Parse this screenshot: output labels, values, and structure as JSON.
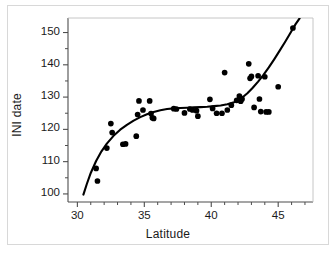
{
  "chart_data": {
    "type": "scatter",
    "title": "",
    "xlabel": "Latitude",
    "ylabel": "INI date",
    "xlim": [
      29.3,
      47.6
    ],
    "ylim": [
      97.5,
      154.5
    ],
    "grid": false,
    "legend": "none",
    "xticks": [
      30,
      35,
      40,
      45
    ],
    "xtick_labels": [
      "30",
      "35",
      "40",
      "45"
    ],
    "xminor_ticks": [
      31,
      32,
      33,
      34,
      36,
      37,
      38,
      39,
      41,
      42,
      43,
      44,
      46,
      47
    ],
    "yticks": [
      100,
      110,
      120,
      130,
      140,
      150
    ],
    "ytick_labels": [
      "100",
      "110",
      "120",
      "130",
      "140",
      "150"
    ],
    "yminor_ticks": [
      105,
      115,
      125,
      135,
      145
    ],
    "marker": "filled-circle",
    "marker_color": "#000000",
    "marker_size": 4.4,
    "series": [
      {
        "name": "observations",
        "points": [
          [
            31.4,
            107.9
          ],
          [
            31.5,
            104.0
          ],
          [
            32.2,
            114.2
          ],
          [
            32.5,
            121.8
          ],
          [
            32.6,
            119.0
          ],
          [
            33.4,
            115.4
          ],
          [
            33.6,
            115.5
          ],
          [
            34.4,
            117.9
          ],
          [
            34.5,
            124.6
          ],
          [
            34.6,
            128.8
          ],
          [
            34.9,
            126.0
          ],
          [
            35.4,
            128.8
          ],
          [
            35.5,
            124.9
          ],
          [
            35.6,
            123.6
          ],
          [
            35.7,
            123.4
          ],
          [
            37.2,
            126.4
          ],
          [
            37.4,
            126.3
          ],
          [
            38.0,
            125.1
          ],
          [
            38.4,
            126.3
          ],
          [
            38.6,
            126.0
          ],
          [
            38.9,
            125.8
          ],
          [
            39.0,
            124.1
          ],
          [
            39.9,
            129.3
          ],
          [
            40.1,
            126.5
          ],
          [
            40.4,
            125.0
          ],
          [
            40.8,
            125.0
          ],
          [
            41.0,
            137.6
          ],
          [
            41.2,
            126.0
          ],
          [
            41.5,
            127.5
          ],
          [
            41.9,
            129.0
          ],
          [
            42.1,
            130.3
          ],
          [
            42.2,
            129.7
          ],
          [
            42.2,
            128.7
          ],
          [
            42.3,
            129.4
          ],
          [
            42.8,
            140.3
          ],
          [
            42.9,
            135.8
          ],
          [
            43.0,
            136.4
          ],
          [
            43.2,
            126.8
          ],
          [
            43.5,
            136.6
          ],
          [
            43.6,
            129.4
          ],
          [
            43.7,
            125.5
          ],
          [
            44.0,
            136.3
          ],
          [
            44.1,
            125.4
          ],
          [
            44.3,
            125.4
          ],
          [
            45.0,
            133.2
          ],
          [
            46.1,
            151.4
          ]
        ]
      }
    ],
    "fit_curve": {
      "name": "fitted-trend",
      "color": "#000000",
      "line_width": 2.1,
      "points": [
        [
          30.45,
          99.8
        ],
        [
          30.7,
          103.0
        ],
        [
          31.0,
          106.5
        ],
        [
          31.4,
          110.2
        ],
        [
          31.8,
          113.2
        ],
        [
          32.2,
          115.6
        ],
        [
          32.7,
          118.0
        ],
        [
          33.2,
          119.9
        ],
        [
          33.7,
          121.4
        ],
        [
          34.2,
          122.7
        ],
        [
          34.7,
          123.8
        ],
        [
          35.2,
          124.7
        ],
        [
          35.7,
          125.4
        ],
        [
          36.2,
          125.9
        ],
        [
          36.7,
          126.3
        ],
        [
          37.2,
          126.5
        ],
        [
          37.7,
          126.6
        ],
        [
          38.2,
          126.7
        ],
        [
          38.7,
          126.8
        ],
        [
          39.2,
          126.9
        ],
        [
          39.7,
          127.0
        ],
        [
          40.2,
          127.2
        ],
        [
          40.7,
          127.4
        ],
        [
          41.2,
          127.8
        ],
        [
          41.7,
          128.4
        ],
        [
          42.0,
          129.0
        ],
        [
          42.3,
          129.8
        ],
        [
          42.7,
          131.2
        ],
        [
          43.1,
          132.9
        ],
        [
          43.5,
          134.8
        ],
        [
          43.9,
          136.9
        ],
        [
          44.3,
          139.2
        ],
        [
          44.7,
          141.7
        ],
        [
          45.1,
          144.3
        ],
        [
          45.5,
          147.0
        ],
        [
          45.9,
          149.8
        ],
        [
          46.3,
          152.6
        ],
        [
          46.6,
          154.4
        ]
      ]
    }
  },
  "axes": {
    "frame_color": "#4d4d4d",
    "background": "#ffffff"
  }
}
